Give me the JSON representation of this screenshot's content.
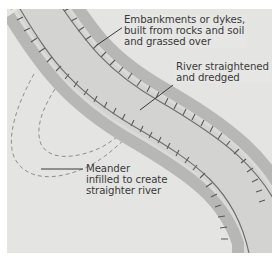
{
  "diagram": {
    "labels": {
      "embankments": {
        "line1": "Embankments or dykes,",
        "line2": "built from rocks and soil",
        "line3": "and grassed over"
      },
      "straightened": {
        "line1": "River straightened",
        "line2": "and dredged"
      },
      "meander": {
        "line1": "Meander",
        "line2": "infilled to create",
        "line3": "straighter river"
      }
    },
    "colors": {
      "background": "#e4e4e2",
      "embankment": "#b7b7b5",
      "channel": "#d6d6d4",
      "riverbank_line": "#6e6e6e",
      "hatch": "#5a5a5a",
      "dashed_meander": "#8e8e8e",
      "text": "#3a3a3a"
    }
  }
}
